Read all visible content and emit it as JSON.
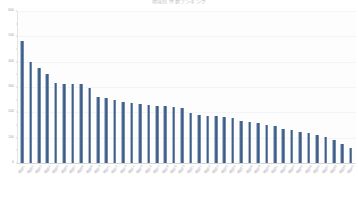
{
  "chart_data": {
    "type": "bar",
    "title": "地域別 件数ランキング",
    "xlabel": "",
    "ylabel": "",
    "ylim": [
      0,
      600
    ],
    "grid": true,
    "legend": "none",
    "orientation": "vertical",
    "sorted": "descending",
    "bar_color": "#4a6a93",
    "y_ticks": [
      0,
      100,
      200,
      300,
      400,
      500,
      600
    ],
    "y_tick_labels": [
      "0",
      "100",
      "200",
      "300",
      "400",
      "500",
      "600"
    ],
    "categories": [
      "項目01",
      "項目02",
      "項目03",
      "項目04",
      "項目05",
      "項目06",
      "項目07",
      "項目08",
      "項目09",
      "項目10",
      "項目11",
      "項目12",
      "項目13",
      "項目14",
      "項目15",
      "項目16",
      "項目17",
      "項目18",
      "項目19",
      "項目20",
      "項目21",
      "項目22",
      "項目23",
      "項目24",
      "項目25",
      "項目26",
      "項目27",
      "項目28",
      "項目29",
      "項目30",
      "項目31",
      "項目32",
      "項目33",
      "項目34",
      "項目35",
      "項目36",
      "項目37",
      "項目38",
      "項目39",
      "項目40"
    ],
    "values": [
      483,
      399,
      377,
      352,
      316,
      312,
      312,
      312,
      296,
      262,
      256,
      250,
      240,
      238,
      232,
      228,
      226,
      224,
      222,
      216,
      196,
      190,
      186,
      184,
      182,
      176,
      166,
      160,
      158,
      150,
      148,
      136,
      132,
      124,
      118,
      112,
      104,
      92,
      74,
      58
    ]
  }
}
